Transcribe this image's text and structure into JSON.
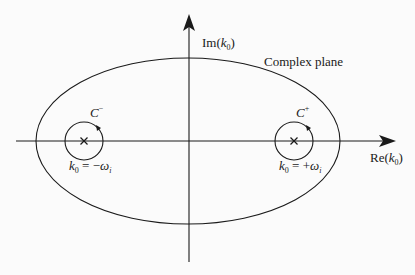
{
  "diagram": {
    "type": "complex-plane-contour",
    "region_label": "Complex plane",
    "axes": {
      "imaginary": {
        "func": "Im",
        "var": "k",
        "sub": "0",
        "open": "(",
        "close": ")"
      },
      "real": {
        "func": "Re",
        "var": "k",
        "sub": "0",
        "open": "(",
        "close": ")"
      }
    },
    "contours": [
      {
        "id": "C-minus",
        "name": "C",
        "sup": "−",
        "pole_var": "k",
        "pole_sub": "0",
        "eq": " = ",
        "sign": "−",
        "omega": "ω",
        "omega_sub": "i",
        "orientation": "counterclockwise"
      },
      {
        "id": "C-plus",
        "name": "C",
        "sup": "+",
        "pole_var": "k",
        "pole_sub": "0",
        "eq": " = ",
        "sign": "+",
        "omega": "ω",
        "omega_sub": "i",
        "orientation": "counterclockwise"
      }
    ],
    "pole_marker": "×",
    "colors": {
      "stroke": "#1a1a1a",
      "background": "#fbfbfb"
    }
  }
}
